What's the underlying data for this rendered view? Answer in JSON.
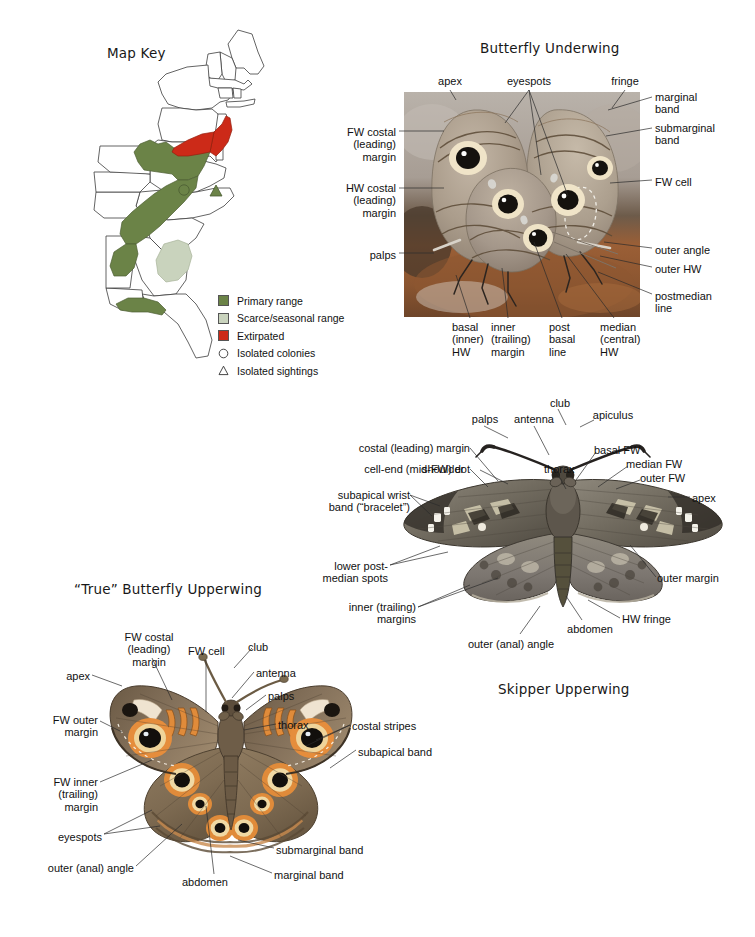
{
  "figure": {
    "background": "#ffffff",
    "line_color": "#2b2b2b"
  },
  "map_panel": {
    "title": "Map Key",
    "colors": {
      "primary_range": "#6b8347",
      "scarce_range": "#c9d3bd",
      "extirpated": "#cc2a18",
      "state_outline": "#3c3c3c",
      "land_fill": "#ffffff"
    },
    "legend": [
      {
        "label": "Primary range",
        "mark": "swatch-green",
        "color": "#6b8347"
      },
      {
        "label": "Scarce/seasonal range",
        "mark": "swatch-pale-green",
        "color": "#c9d3bd"
      },
      {
        "label": "Extirpated",
        "mark": "swatch-red",
        "color": "#cc2a18"
      },
      {
        "label": "Isolated colonies",
        "mark": "circle-outline-icon",
        "color": "#ffffff"
      },
      {
        "label": "Isolated sightings",
        "mark": "triangle-outline-icon",
        "color": "#ffffff"
      }
    ],
    "map_markers": [
      {
        "type": "circle-marker",
        "label": "isolated colony"
      },
      {
        "type": "triangle-marker",
        "label": "isolated sighting"
      }
    ]
  },
  "underwing_panel": {
    "title": "Butterfly Underwing",
    "labels": {
      "apex": "apex",
      "eyespots": "eyespots",
      "fringe": "fringe",
      "marginal_band": "marginal\nband",
      "submarginal_band": "submarginal\nband",
      "fw_costal": "FW costal\n(leading)\nmargin",
      "hw_costal": "HW costal\n(leading)\nmargin",
      "fw_cell": "FW cell",
      "palps": "palps",
      "outer_angle": "outer angle",
      "outer_hw": "outer HW",
      "postmedian_line": "postmedian\nline",
      "basal_hw": "basal\n(inner)\nHW",
      "inner_margin": "inner\n(trailing)\nmargin",
      "post_basal_line": "post\nbasal\nline",
      "median_hw": "median\n(central)\nHW"
    }
  },
  "skipper_panel": {
    "title": "Skipper Upperwing",
    "labels": {
      "palps": "palps",
      "antenna": "antenna",
      "club": "club",
      "apiculus": "apiculus",
      "costal_margin": "costal (leading) margin",
      "cell_end_dot": "cell-end (mid-FW) dot",
      "subapical_wrist_band": "subapical wrist\nband (“bracelet”)",
      "shoulder": "shoulder",
      "thorax": "thorax",
      "basal_fw": "basal FW",
      "median_fw": "median FW",
      "outer_fw": "outer FW",
      "apex": "apex",
      "outer_margin": "outer margin",
      "hw_fringe": "HW fringe",
      "abdomen": "abdomen",
      "outer_anal_angle": "outer (anal) angle",
      "inner_margins": "inner (trailing)\nmargins",
      "lower_postmedian_spots": "lower post-\nmedian spots"
    }
  },
  "upperwing_panel": {
    "title": "“True” Butterfly Upperwing",
    "labels": {
      "fw_costal": "FW costal\n(leading) margin",
      "fw_cell": "FW cell",
      "club": "club",
      "antenna": "antenna",
      "palps": "palps",
      "apex": "apex",
      "fw_outer_margin": "FW outer\nmargin",
      "fw_inner_margin": "FW inner\n(trailing) margin",
      "thorax": "thorax",
      "costal_stripes": "costal stripes",
      "subapical_band": "subapical band",
      "eyespots": "eyespots",
      "outer_anal_angle": "outer (anal) angle",
      "abdomen": "abdomen",
      "marginal_band": "marginal band",
      "submarginal_band": "submarginal band"
    }
  }
}
